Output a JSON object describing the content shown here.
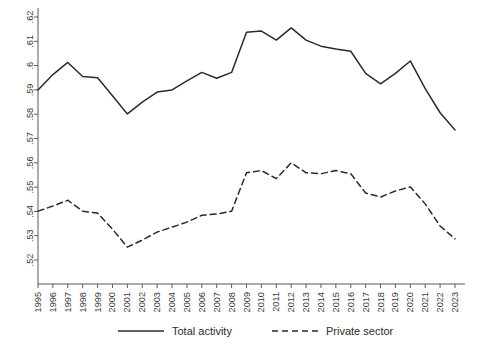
{
  "chart_data": {
    "type": "line",
    "title": "",
    "subtitle": "",
    "xlabel": "",
    "ylabel": "",
    "grid": false,
    "legend_position": "bottom-center",
    "xlim": [
      1995,
      2023
    ],
    "ylim": [
      0.52,
      0.62
    ],
    "ytick_labels": [
      ".52",
      ".53",
      ".54",
      ".55",
      ".56",
      ".57",
      ".58",
      ".59",
      ".6",
      ".61",
      ".62"
    ],
    "ytick_values": [
      0.52,
      0.53,
      0.54,
      0.55,
      0.56,
      0.57,
      0.58,
      0.59,
      0.6,
      0.61,
      0.62
    ],
    "categories": [
      "1995",
      "1996",
      "1997",
      "1998",
      "1999",
      "2000",
      "2001",
      "2002",
      "2003",
      "2004",
      "2005",
      "2006",
      "2007",
      "2008",
      "2009",
      "2010",
      "2011",
      "2012",
      "2013",
      "2014",
      "2015",
      "2016",
      "2017",
      "2018",
      "2019",
      "2020",
      "2021",
      "2022",
      "2023"
    ],
    "x": [
      1995,
      1996,
      1997,
      1998,
      1999,
      2000,
      2001,
      2002,
      2003,
      2004,
      2005,
      2006,
      2007,
      2008,
      2009,
      2010,
      2011,
      2012,
      2013,
      2014,
      2015,
      2016,
      2017,
      2018,
      2019,
      2020,
      2021,
      2022,
      2023
    ],
    "series": [
      {
        "name": "Total activity",
        "style": "solid",
        "color": "#2b2b2b",
        "values": [
          0.59,
          0.5963,
          0.6013,
          0.5955,
          0.595,
          0.5876,
          0.5801,
          0.585,
          0.5891,
          0.59,
          0.5937,
          0.5972,
          0.5948,
          0.5972,
          0.6137,
          0.6142,
          0.6105,
          0.6155,
          0.6105,
          0.608,
          0.6068,
          0.6059,
          0.5968,
          0.5925,
          0.5968,
          0.6019,
          0.5905,
          0.5806,
          0.5735
        ]
      },
      {
        "name": "Private sector",
        "style": "dashed",
        "color": "#2b2b2b",
        "values": [
          0.5401,
          0.5422,
          0.5446,
          0.5401,
          0.5393,
          0.5327,
          0.5253,
          0.5282,
          0.5315,
          0.5335,
          0.5356,
          0.5384,
          0.5389,
          0.5401,
          0.5559,
          0.5568,
          0.5535,
          0.56,
          0.5559,
          0.5555,
          0.5568,
          0.5555,
          0.5476,
          0.5459,
          0.5484,
          0.5501,
          0.5431,
          0.534,
          0.5287
        ]
      }
    ]
  },
  "legend": {
    "items": [
      {
        "label": "Total activity",
        "style": "solid"
      },
      {
        "label": "Private sector",
        "style": "dashed"
      }
    ]
  }
}
